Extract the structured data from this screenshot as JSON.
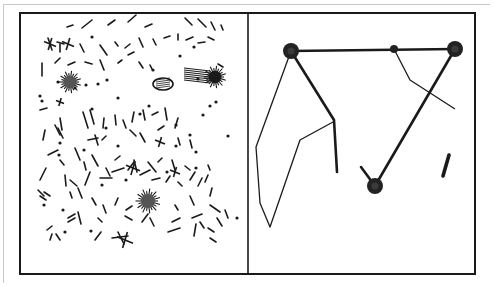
{
  "figure": {
    "ink_color": "#1a1a1a",
    "paper_color": "#ffffff",
    "frame": {
      "x": 20,
      "y": 13,
      "w": 455,
      "h": 261,
      "divider_x": 248
    },
    "left_panel": {
      "description": "scattered fragments, specks and fuzzy clusters",
      "blobs": [
        {
          "cx": 70,
          "cy": 82,
          "r": 9,
          "fuzzy": true
        },
        {
          "cx": 215,
          "cy": 77,
          "r": 9,
          "fuzzy": true,
          "solid": true
        },
        {
          "cx": 148,
          "cy": 201,
          "r": 10,
          "fuzzy": true
        },
        {
          "cx": 163,
          "cy": 84,
          "rx": 10,
          "ry": 6,
          "oval": true
        },
        {
          "cx": 197,
          "cy": 74,
          "rx": 13,
          "ry": 7,
          "hatched": true
        }
      ],
      "dots": [
        [
          92,
          37
        ],
        [
          58,
          82
        ],
        [
          40,
          96
        ],
        [
          75,
          88
        ],
        [
          86,
          85
        ],
        [
          98,
          84
        ],
        [
          107,
          80
        ],
        [
          92,
          109
        ],
        [
          59,
          155
        ],
        [
          84,
          150
        ],
        [
          118,
          146
        ],
        [
          153,
          70
        ],
        [
          180,
          56
        ],
        [
          194,
          47
        ],
        [
          198,
          79
        ],
        [
          228,
          136
        ],
        [
          106,
          128
        ],
        [
          196,
          168
        ],
        [
          167,
          172
        ],
        [
          44,
          205
        ],
        [
          63,
          210
        ],
        [
          237,
          218
        ],
        [
          196,
          152
        ],
        [
          60,
          143
        ],
        [
          176,
          125
        ],
        [
          140,
          114
        ],
        [
          118,
          98
        ],
        [
          149,
          106
        ],
        [
          65,
          232
        ],
        [
          91,
          231
        ],
        [
          42,
          101
        ],
        [
          203,
          115
        ],
        [
          190,
          135
        ],
        [
          210,
          106
        ],
        [
          176,
          146
        ],
        [
          216,
          102
        ],
        [
          102,
          185
        ],
        [
          126,
          180
        ]
      ],
      "strokes": [
        [
          67,
          27,
          73,
          25
        ],
        [
          82,
          28,
          92,
          20
        ],
        [
          108,
          25,
          115,
          20
        ],
        [
          128,
          22,
          136,
          15
        ],
        [
          145,
          27,
          152,
          24
        ],
        [
          185,
          18,
          192,
          25
        ],
        [
          198,
          19,
          206,
          27
        ],
        [
          211,
          22,
          215,
          30
        ],
        [
          221,
          25,
          223,
          30
        ],
        [
          48,
          38,
          52,
          50
        ],
        [
          57,
          42,
          64,
          44
        ],
        [
          60,
          44,
          60,
          52
        ],
        [
          80,
          44,
          84,
          52
        ],
        [
          100,
          45,
          107,
          55
        ],
        [
          115,
          42,
          118,
          46
        ],
        [
          125,
          48,
          130,
          44
        ],
        [
          139,
          38,
          143,
          47
        ],
        [
          153,
          39,
          156,
          45
        ],
        [
          164,
          38,
          170,
          36
        ],
        [
          178,
          34,
          178,
          40
        ],
        [
          186,
          40,
          193,
          37
        ],
        [
          198,
          43,
          205,
          42
        ],
        [
          208,
          37,
          214,
          40
        ],
        [
          42,
          63,
          42,
          76
        ],
        [
          55,
          63,
          60,
          58
        ],
        [
          68,
          65,
          75,
          62
        ],
        [
          85,
          62,
          92,
          64
        ],
        [
          100,
          60,
          104,
          70
        ],
        [
          118,
          63,
          122,
          60
        ],
        [
          128,
          55,
          134,
          52
        ],
        [
          139,
          62,
          143,
          68
        ],
        [
          150,
          65,
          152,
          69
        ],
        [
          218,
          64,
          223,
          67
        ],
        [
          40,
          110,
          47,
          108
        ],
        [
          45,
          130,
          43,
          140
        ],
        [
          60,
          118,
          62,
          130
        ],
        [
          83,
          112,
          88,
          128
        ],
        [
          90,
          110,
          94,
          124
        ],
        [
          104,
          118,
          103,
          128
        ],
        [
          115,
          115,
          116,
          125
        ],
        [
          123,
          120,
          126,
          128
        ],
        [
          134,
          112,
          132,
          122
        ],
        [
          143,
          110,
          145,
          120
        ],
        [
          152,
          115,
          158,
          112
        ],
        [
          165,
          108,
          167,
          120
        ],
        [
          178,
          118,
          175,
          128
        ],
        [
          55,
          125,
          60,
          135
        ],
        [
          58,
          128,
          63,
          138
        ],
        [
          88,
          140,
          98,
          138
        ],
        [
          95,
          135,
          98,
          145
        ],
        [
          102,
          140,
          106,
          136
        ],
        [
          130,
          130,
          136,
          136
        ],
        [
          140,
          133,
          145,
          142
        ],
        [
          158,
          130,
          164,
          126
        ],
        [
          178,
          138,
          180,
          145
        ],
        [
          190,
          140,
          192,
          148
        ],
        [
          48,
          155,
          58,
          150
        ],
        [
          60,
          160,
          64,
          165
        ],
        [
          75,
          148,
          80,
          160
        ],
        [
          84,
          162,
          86,
          170
        ],
        [
          92,
          155,
          98,
          166
        ],
        [
          106,
          168,
          110,
          176
        ],
        [
          115,
          160,
          120,
          156
        ],
        [
          128,
          170,
          134,
          162
        ],
        [
          134,
          160,
          137,
          172
        ],
        [
          148,
          162,
          156,
          172
        ],
        [
          158,
          162,
          162,
          158
        ],
        [
          172,
          160,
          175,
          170
        ],
        [
          185,
          166,
          190,
          170
        ],
        [
          208,
          175,
          205,
          182
        ],
        [
          208,
          165,
          210,
          170
        ],
        [
          40,
          180,
          46,
          168
        ],
        [
          65,
          175,
          66,
          186
        ],
        [
          70,
          180,
          77,
          186
        ],
        [
          85,
          185,
          90,
          172
        ],
        [
          100,
          178,
          112,
          178
        ],
        [
          112,
          172,
          124,
          168
        ],
        [
          140,
          175,
          150,
          170
        ],
        [
          152,
          180,
          160,
          178
        ],
        [
          166,
          182,
          170,
          176
        ],
        [
          178,
          182,
          182,
          186
        ],
        [
          190,
          180,
          195,
          172
        ],
        [
          198,
          186,
          202,
          178
        ],
        [
          210,
          196,
          212,
          188
        ],
        [
          38,
          190,
          44,
          196
        ],
        [
          40,
          196,
          46,
          200
        ],
        [
          44,
          192,
          50,
          196
        ],
        [
          70,
          192,
          72,
          198
        ],
        [
          78,
          188,
          82,
          198
        ],
        [
          92,
          198,
          96,
          205
        ],
        [
          103,
          205,
          106,
          213
        ],
        [
          115,
          205,
          118,
          198
        ],
        [
          126,
          210,
          132,
          206
        ],
        [
          175,
          205,
          178,
          210
        ],
        [
          190,
          196,
          194,
          205
        ],
        [
          210,
          205,
          220,
          212
        ],
        [
          225,
          210,
          228,
          218
        ],
        [
          68,
          218,
          75,
          214
        ],
        [
          68,
          222,
          75,
          218
        ],
        [
          78,
          212,
          81,
          224
        ],
        [
          98,
          218,
          102,
          222
        ],
        [
          125,
          216,
          132,
          220
        ],
        [
          142,
          222,
          148,
          214
        ],
        [
          150,
          218,
          154,
          226
        ],
        [
          172,
          222,
          180,
          218
        ],
        [
          192,
          218,
          202,
          214
        ],
        [
          200,
          222,
          204,
          228
        ],
        [
          217,
          218,
          222,
          226
        ],
        [
          47,
          230,
          52,
          226
        ],
        [
          52,
          234,
          50,
          240
        ],
        [
          56,
          234,
          60,
          240
        ],
        [
          95,
          240,
          101,
          232
        ],
        [
          112,
          238,
          128,
          236
        ],
        [
          118,
          232,
          124,
          244
        ],
        [
          168,
          232,
          180,
          228
        ],
        [
          194,
          236,
          196,
          224
        ],
        [
          208,
          228,
          214,
          232
        ],
        [
          210,
          238,
          216,
          242
        ]
      ],
      "crosses": [
        {
          "x": 50,
          "y": 44,
          "s": 6
        },
        {
          "x": 68,
          "y": 44,
          "s": 6
        },
        {
          "x": 133,
          "y": 168,
          "s": 7
        },
        {
          "x": 160,
          "y": 142,
          "s": 5
        },
        {
          "x": 125,
          "y": 240,
          "s": 8
        },
        {
          "x": 175,
          "y": 172,
          "s": 5
        },
        {
          "x": 60,
          "y": 102,
          "s": 4
        }
      ]
    },
    "right_panel": {
      "description": "network of nodes connected by thick and thin lines",
      "nodes": [
        {
          "id": "top-left",
          "cx": 291,
          "cy": 51,
          "r": 8
        },
        {
          "id": "top-mid",
          "cx": 394,
          "cy": 49,
          "r": 4
        },
        {
          "id": "top-right",
          "cx": 455,
          "cy": 49,
          "r": 8
        },
        {
          "id": "bottom",
          "cx": 375,
          "cy": 186,
          "r": 8
        }
      ],
      "thick_lines": [
        {
          "points": "291,51 455,49",
          "w": 2.6
        },
        {
          "points": "291,51 334,120 337,172",
          "w": 2.6
        },
        {
          "points": "455,49 375,186",
          "w": 2.6
        },
        {
          "points": "361,167 375,186",
          "w": 2.6
        },
        {
          "points": "449,155 443,176",
          "w": 3.6
        }
      ],
      "thin_lines": [
        {
          "points": "291,51 256,147 260,203 270,227 300,140 333,122",
          "w": 1.3
        },
        {
          "points": "394,49 410,80 455,109",
          "w": 1.3
        }
      ]
    }
  }
}
